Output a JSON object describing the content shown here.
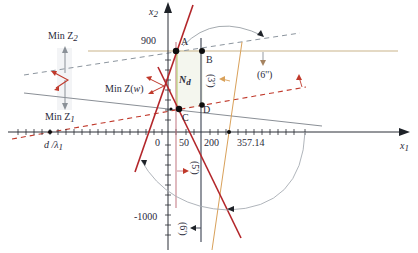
{
  "figure": {
    "type": "linear-programming-feasible-region",
    "axes": {
      "x_label": "x",
      "x_sub": "1",
      "y_label": "x",
      "y_sub": "2",
      "x_ticks": [
        "0",
        "50",
        "200",
        "357.14"
      ],
      "y_ticks": [
        "900",
        "-1000"
      ],
      "x_extra_label": "d /λ",
      "x_extra_sub": "1"
    },
    "points": {
      "A": "A",
      "B": "B",
      "C": "C",
      "D": "D"
    },
    "region_label": "N",
    "region_sub": "d",
    "objectives": {
      "min_z2": "Min Z",
      "min_z2_sub": "2",
      "min_z1": "Min Z",
      "min_z1_sub": "1",
      "min_zw": "Min Z(",
      "min_zw_w": "w",
      "min_zw_close": ")"
    },
    "constraint_labels": {
      "c3": "(3')",
      "c4": "(4')",
      "c5": "(5')",
      "c6p": "(6')",
      "c6pp": "(6'')"
    },
    "colors": {
      "red_line": "#b3262a",
      "red_dash": "#c0392b",
      "gray_line": "#8a8f96",
      "dash_gray": "#8c959e",
      "orange_line": "#d9a15a",
      "navy_line": "#3a4050",
      "pink_line": "#c7808a",
      "olive_line": "#c7b07a",
      "axis": "#2b2f36",
      "region_edge": "#bcd27a"
    }
  }
}
